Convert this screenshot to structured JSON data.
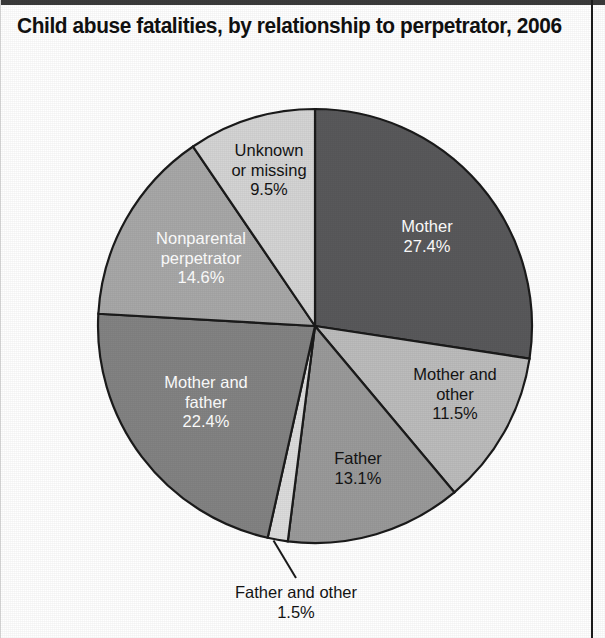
{
  "title": "Child abuse fatalities, by relationship to perpetrator, 2006",
  "chart_data": {
    "type": "pie",
    "title": "Child abuse fatalities, by relationship to perpetrator, 2006",
    "xlabel": "",
    "ylabel": "",
    "units": "percent",
    "legend": "none (slices labeled in place)",
    "grid": false,
    "start_angle_deg": 0,
    "direction": "clockwise",
    "categories": [
      "Mother",
      "Mother and other",
      "Father",
      "Father and other",
      "Mother and father",
      "Nonparental perpetrator",
      "Unknown or missing"
    ],
    "values": [
      27.4,
      11.5,
      13.1,
      1.5,
      22.4,
      14.6,
      9.5
    ],
    "slices": [
      {
        "name": "Mother",
        "label": "Mother",
        "value": 27.4,
        "value_text": "27.4%",
        "color": "#59595b",
        "text_color": "#ffffff",
        "label_position": "inside",
        "lines": [
          "Mother",
          "27.4%"
        ]
      },
      {
        "name": "Mother and other",
        "label": "Mother and other",
        "value": 11.5,
        "value_text": "11.5%",
        "color": "#bcbcbc",
        "text_color": "#141414",
        "label_position": "inside",
        "lines": [
          "Mother and",
          "other",
          "11.5%"
        ]
      },
      {
        "name": "Father",
        "label": "Father",
        "value": 13.1,
        "value_text": "13.1%",
        "color": "#9a9a9a",
        "text_color": "#141414",
        "label_position": "inside",
        "lines": [
          "Father",
          "13.1%"
        ]
      },
      {
        "name": "Father and other",
        "label": "Father and other",
        "value": 1.5,
        "value_text": "1.5%",
        "color": "#dcdcdc",
        "text_color": "#141414",
        "label_position": "callout-below",
        "lines": [
          "Father and other",
          "1.5%"
        ]
      },
      {
        "name": "Mother and father",
        "label": "Mother and father",
        "value": 22.4,
        "value_text": "22.4%",
        "color": "#838383",
        "text_color": "#ffffff",
        "label_position": "inside",
        "lines": [
          "Mother and",
          "father",
          "22.4%"
        ]
      },
      {
        "name": "Nonparental perpetrator",
        "label": "Nonparental perpetrator",
        "value": 14.6,
        "value_text": "14.6%",
        "color": "#a8a8a8",
        "text_color": "#ffffff",
        "label_position": "inside",
        "lines": [
          "Nonparental",
          "perpetrator",
          "14.6%"
        ]
      },
      {
        "name": "Unknown or missing",
        "label": "Unknown or missing",
        "value": 9.5,
        "value_text": "9.5%",
        "color": "#d4d4d4",
        "text_color": "#141414",
        "label_position": "inside",
        "lines": [
          "Unknown",
          "or missing",
          "9.5%"
        ]
      }
    ]
  },
  "labels": {
    "mother_l1": "Mother",
    "mother_l2": "27.4%",
    "mother_other_l1": "Mother and",
    "mother_other_l2": "other",
    "mother_other_l3": "11.5%",
    "father_l1": "Father",
    "father_l2": "13.1%",
    "father_other_l1": "Father and other",
    "father_other_l2": "1.5%",
    "mother_father_l1": "Mother and",
    "mother_father_l2": "father",
    "mother_father_l3": "22.4%",
    "nonparental_l1": "Nonparental",
    "nonparental_l2": "perpetrator",
    "nonparental_l3": "14.6%",
    "unknown_l1": "Unknown",
    "unknown_l2": "or missing",
    "unknown_l3": "9.5%"
  }
}
